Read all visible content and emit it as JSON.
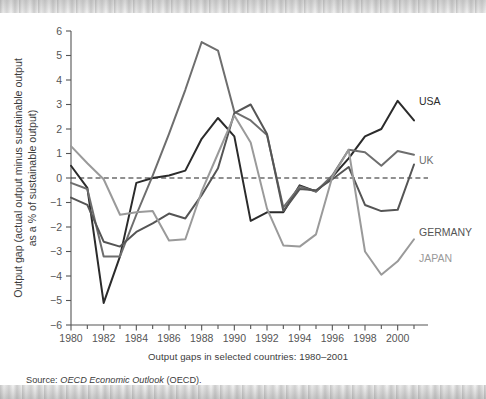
{
  "figure": {
    "caption": "Output gaps in selected countries: 1980–2001",
    "source_prefix": "Source:",
    "source_italic": "OECD Economic Outlook",
    "source_suffix": "(OECD)."
  },
  "axis": {
    "y_label_line1": "Output gap (actual output minus sustainable output",
    "y_label_line2": "as a % of sustainable output)",
    "y_ticks": [
      "6",
      "5",
      "4",
      "3",
      "2",
      "1",
      "0",
      "−1",
      "−2",
      "−3",
      "−4",
      "−5",
      "−6"
    ],
    "x_ticks": [
      "1980",
      "1982",
      "1984",
      "1986",
      "1988",
      "1990",
      "1992",
      "1994",
      "1996",
      "1998",
      "2000"
    ]
  },
  "series_labels": {
    "usa": "USA",
    "uk": "UK",
    "germany": "GERMANY",
    "japan": "JAPAN"
  },
  "colors": {
    "usa": "#2b2b2b",
    "uk": "#6e6e6e",
    "germany": "#555555",
    "japan": "#9a9a9a",
    "axis": "#555555",
    "zero_line": "#222222",
    "background": "#ffffff"
  },
  "chart_data": {
    "type": "line",
    "title": "Output gaps in selected countries: 1980–2001",
    "xlabel": "",
    "ylabel": "Output gap (actual output minus sustainable output as a % of sustainable output)",
    "xlim": [
      1980,
      2001
    ],
    "ylim": [
      -6,
      6
    ],
    "grid": false,
    "legend": "inline-right-end-labels",
    "annotations": [
      {
        "text": "zero reference line",
        "y": 0,
        "style": "dashed"
      }
    ],
    "x": [
      1980,
      1981,
      1982,
      1983,
      1984,
      1985,
      1986,
      1987,
      1988,
      1989,
      1990,
      1991,
      1992,
      1993,
      1994,
      1995,
      1996,
      1997,
      1998,
      1999,
      2000,
      2001
    ],
    "series": [
      {
        "name": "USA",
        "color": "#2b2b2b",
        "values": [
          0.5,
          -0.4,
          -5.1,
          -3.2,
          -0.2,
          0.0,
          0.1,
          0.3,
          1.6,
          2.45,
          1.7,
          -1.75,
          -1.4,
          -1.4,
          -0.3,
          -0.55,
          0.05,
          0.8,
          1.7,
          2.0,
          3.15,
          2.35
        ]
      },
      {
        "name": "UK",
        "color": "#6e6e6e",
        "values": [
          -0.2,
          -0.45,
          -3.2,
          -3.2,
          -1.5,
          0.1,
          1.8,
          3.6,
          5.55,
          5.2,
          2.7,
          2.35,
          1.75,
          -1.2,
          -0.35,
          -0.55,
          0.1,
          1.15,
          1.05,
          0.5,
          1.1,
          0.95
        ]
      },
      {
        "name": "GERMANY",
        "color": "#555555",
        "values": [
          -0.8,
          -1.1,
          -2.6,
          -2.8,
          -2.2,
          -1.85,
          -1.45,
          -1.65,
          -0.7,
          0.4,
          2.65,
          3.0,
          1.8,
          -1.35,
          -0.45,
          -0.5,
          -0.05,
          0.45,
          -1.1,
          -1.35,
          -1.3,
          0.55
        ]
      },
      {
        "name": "JAPAN",
        "color": "#9a9a9a",
        "values": [
          1.3,
          0.6,
          -0.05,
          -1.5,
          -1.4,
          -1.35,
          -2.55,
          -2.5,
          -0.55,
          1.0,
          2.55,
          1.45,
          -1.25,
          -2.75,
          -2.8,
          -2.3,
          0.05,
          1.15,
          -3.0,
          -3.95,
          -3.4,
          -2.5
        ]
      }
    ]
  }
}
